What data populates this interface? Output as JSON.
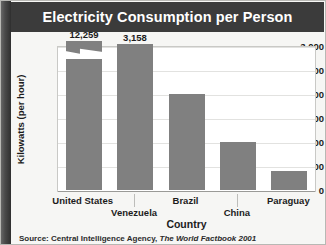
{
  "title": "Electricity Consumption per Person",
  "source": {
    "prefix": "Source: Central Intelligence Agency,",
    "publication": "The World Factbook 2001"
  },
  "colors": {
    "title_bar": "#3b3b3b",
    "title_text": "#ffffff",
    "bar": "#808080",
    "gridline": "#e2e2e0",
    "plot_background": "#ffffff",
    "figure_background": "#f6f6f4"
  },
  "chart_data": {
    "type": "bar",
    "title": "Electricity Consumption per Person",
    "xlabel": "Country",
    "ylabel": "Kilowatts (per hour)",
    "categories": [
      "United States",
      "Venezuela",
      "Brazil",
      "China",
      "Paraguay"
    ],
    "values": [
      12259,
      3158,
      2010,
      1000,
      400
    ],
    "plotted_values": [
      3100,
      3050,
      2010,
      1000,
      400
    ],
    "data_labels": [
      "12,259",
      "3,158",
      "",
      "",
      ""
    ],
    "axis_break": {
      "series_index": 0,
      "note": "United States bar is truncated with a zigzag break; actual value 12,259 exceeds the axis maximum"
    },
    "ylim": [
      0,
      3000
    ],
    "ytick_labels": [
      "3,000",
      "2,500",
      "2,000",
      "1,500",
      "1,000",
      "500",
      "0"
    ],
    "ytick_values": [
      3000,
      2500,
      2000,
      1500,
      1000,
      500,
      0
    ],
    "grid": true,
    "legend": "none"
  }
}
